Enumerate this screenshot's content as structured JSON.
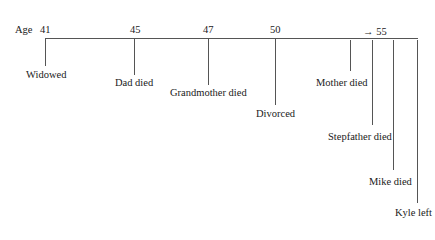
{
  "axis": {
    "label": "Age",
    "ticks": [
      {
        "label": "41",
        "x": 40
      },
      {
        "label": "45",
        "x": 130
      },
      {
        "label": "47",
        "x": 203
      },
      {
        "label": "50",
        "x": 270
      },
      {
        "label": "→ 55",
        "x": 363
      }
    ]
  },
  "events": [
    {
      "label": "Widowed",
      "line_x": 45,
      "line_end": 66,
      "text_x": 26,
      "text_y": 70
    },
    {
      "label": "Dad died",
      "line_x": 134,
      "line_end": 75,
      "text_x": 115,
      "text_y": 78
    },
    {
      "label": "Grandmother died",
      "line_x": 208,
      "line_end": 85,
      "text_x": 170,
      "text_y": 88
    },
    {
      "label": "Divorced",
      "line_x": 275,
      "line_end": 105,
      "text_x": 256,
      "text_y": 109
    },
    {
      "label": "Mother died",
      "line_x": 350,
      "line_end": 71,
      "text_x": 316,
      "text_y": 78
    },
    {
      "label": "Stepfather died",
      "line_x": 372,
      "line_end": 125,
      "text_x": 328,
      "text_y": 132
    },
    {
      "label": "Mike died",
      "line_x": 393,
      "line_end": 170,
      "text_x": 369,
      "text_y": 177
    },
    {
      "label": "Kyle left",
      "line_x": 417,
      "line_end": 203,
      "text_x": 395,
      "text_y": 208
    }
  ]
}
